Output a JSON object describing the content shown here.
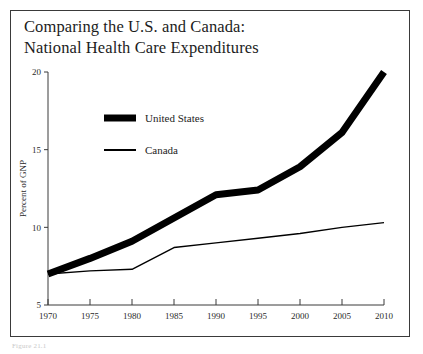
{
  "figure": {
    "title_line1": "Comparing the U.S. and Canada:",
    "title_line2": "National Health Care Expenditures",
    "title_full": "Comparing the U.S. and Canada:\nNational Health Care Expenditures",
    "caption": "Figure 21.1",
    "border_color": "#3a3a3a",
    "background": "#ffffff"
  },
  "chart_data": {
    "type": "line",
    "title": "Comparing the U.S. and Canada: National Health Care Expenditures",
    "xlabel": "",
    "ylabel": "Percent of GNP",
    "x": [
      1970,
      1975,
      1980,
      1985,
      1990,
      1995,
      2000,
      2005,
      2010
    ],
    "xticklabels": [
      "1970",
      "1975",
      "1980",
      "1985",
      "1990",
      "1995",
      "2000",
      "2005",
      "2010"
    ],
    "yticks": [
      5,
      10,
      15,
      20
    ],
    "yticklabels": [
      "5",
      "10",
      "15",
      "20"
    ],
    "xlim": [
      1970,
      2010
    ],
    "ylim": [
      5,
      20
    ],
    "grid": false,
    "legend_position": "upper-left-inside",
    "series": [
      {
        "name": "United States",
        "values": [
          7.0,
          8.0,
          9.1,
          10.6,
          12.1,
          12.4,
          13.9,
          16.1,
          20.0
        ],
        "color": "#000000",
        "line_width": 7
      },
      {
        "name": "Canada",
        "values": [
          7.0,
          7.2,
          7.3,
          8.7,
          9.0,
          9.3,
          9.6,
          10.0,
          10.3
        ],
        "color": "#000000",
        "line_width": 1.4
      }
    ]
  },
  "legend": {
    "items": [
      {
        "label": "United States",
        "swatch": "thick-bar"
      },
      {
        "label": "Canada",
        "swatch": "thin-bar"
      }
    ]
  }
}
